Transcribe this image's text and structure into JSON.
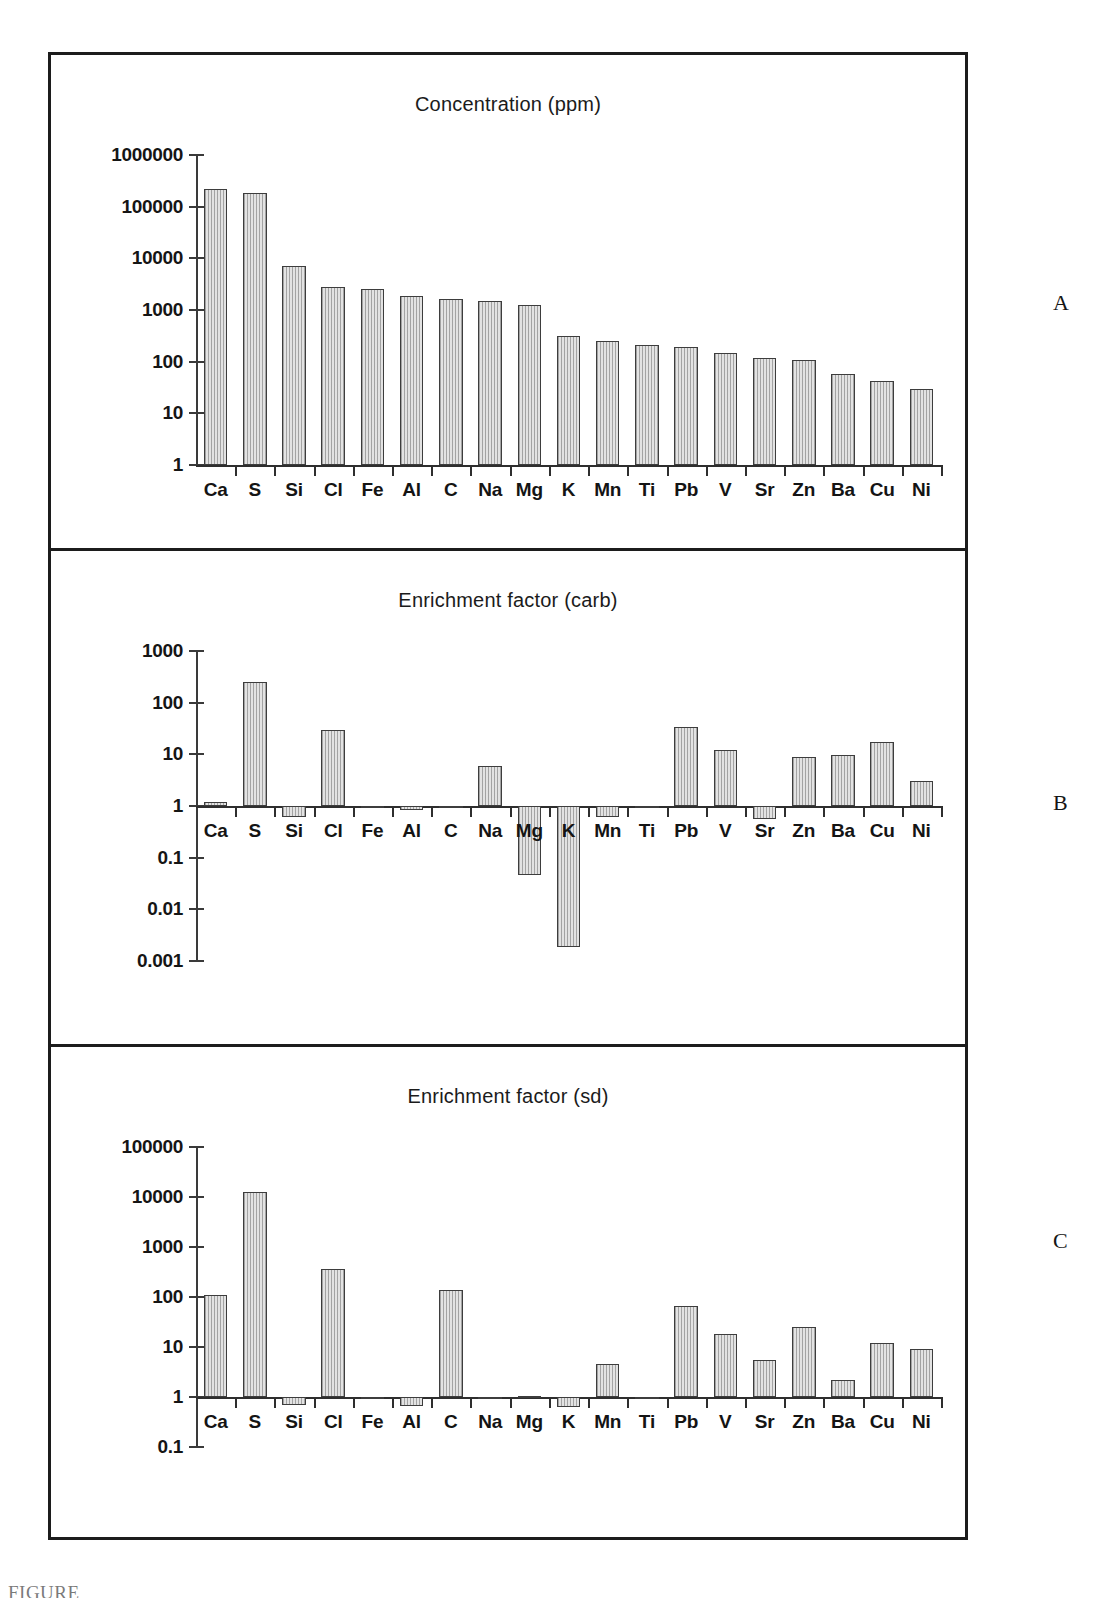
{
  "figure": {
    "caption_partial": "FIGURE",
    "panel_letters": [
      "A",
      "B",
      "C"
    ]
  },
  "chart_data": [
    {
      "type": "bar",
      "panel": "A",
      "title": "Concentration (ppm)",
      "xlabel": "",
      "ylabel": "",
      "yscale": "log",
      "ylim": [
        1,
        1000000
      ],
      "yticks": [
        "1",
        "10",
        "100",
        "1000",
        "10000",
        "100000",
        "1000000"
      ],
      "ytick_values": [
        1,
        10,
        100,
        1000,
        10000,
        100000,
        1000000
      ],
      "baseline": 1,
      "grid": false,
      "legend": "none",
      "categories": [
        "Ca",
        "S",
        "Si",
        "Cl",
        "Fe",
        "Al",
        "C",
        "Na",
        "Mg",
        "K",
        "Mn",
        "Ti",
        "Pb",
        "V",
        "Sr",
        "Zn",
        "Ba",
        "Cu",
        "Ni"
      ],
      "values": [
        220000,
        180000,
        7000,
        2800,
        2500,
        1900,
        1600,
        1500,
        1250,
        320,
        250,
        210,
        190,
        150,
        120,
        110,
        58,
        42,
        30
      ]
    },
    {
      "type": "bar",
      "panel": "B",
      "title": "Enrichment factor (carb)",
      "xlabel": "",
      "ylabel": "",
      "yscale": "log",
      "ylim": [
        0.001,
        1000
      ],
      "yticks": [
        "1000",
        "100",
        "10",
        "1",
        "0.1",
        "0.01",
        "0.001"
      ],
      "ytick_values": [
        1000,
        100,
        10,
        1,
        0.1,
        0.01,
        0.001
      ],
      "baseline": 1,
      "grid": false,
      "legend": "none",
      "categories": [
        "Ca",
        "S",
        "Si",
        "Cl",
        "Fe",
        "Al",
        "C",
        "Na",
        "Mg",
        "K",
        "Mn",
        "Ti",
        "Pb",
        "V",
        "Sr",
        "Zn",
        "Ba",
        "Cu",
        "Ni"
      ],
      "values": [
        1.2,
        250,
        0.6,
        30,
        1.02,
        0.85,
        1.0,
        6.0,
        0.047,
        0.0019,
        0.6,
        1.0,
        34,
        12,
        0.55,
        8.8,
        9.5,
        17,
        3.1
      ]
    },
    {
      "type": "bar",
      "panel": "C",
      "title": "Enrichment factor (sd)",
      "xlabel": "",
      "ylabel": "",
      "yscale": "log",
      "ylim": [
        0.1,
        100000
      ],
      "yticks": [
        "100000",
        "10000",
        "1000",
        "100",
        "10",
        "1",
        "0.1"
      ],
      "ytick_values": [
        100000,
        10000,
        1000,
        100,
        10,
        1,
        0.1
      ],
      "baseline": 1,
      "grid": false,
      "legend": "none",
      "categories": [
        "Ca",
        "S",
        "Si",
        "Cl",
        "Fe",
        "Al",
        "C",
        "Na",
        "Mg",
        "K",
        "Mn",
        "Ti",
        "Pb",
        "V",
        "Sr",
        "Zn",
        "Ba",
        "Cu",
        "Ni"
      ],
      "values": [
        110,
        12500,
        0.7,
        370,
        0.95,
        0.65,
        135,
        1.0,
        1.05,
        0.63,
        4.5,
        1.0,
        65,
        18,
        5.5,
        25,
        2.2,
        12,
        9.2
      ]
    }
  ]
}
